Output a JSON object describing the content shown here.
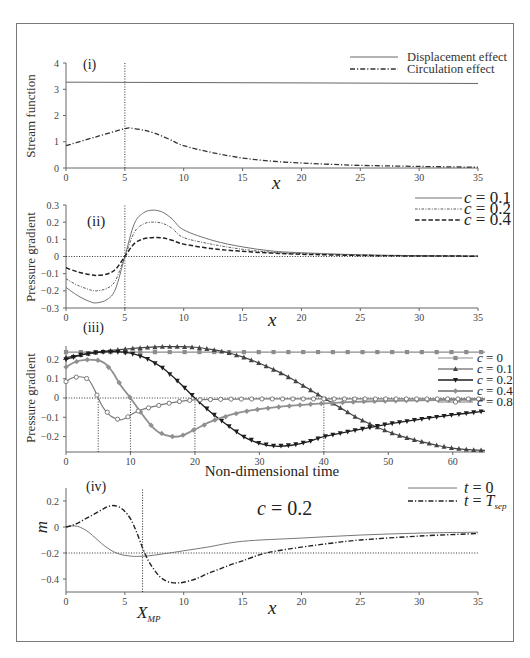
{
  "chart_data": [
    {
      "panel": "(i)",
      "type": "line",
      "title": "",
      "xlabel": "x",
      "ylabel": "Stream function",
      "xlim": [
        0,
        35
      ],
      "ylim": [
        0,
        4
      ],
      "xticks": [
        0,
        5,
        10,
        15,
        20,
        25,
        30,
        35
      ],
      "xtick_labels": [
        "0",
        "5",
        "10",
        "15",
        "20",
        "25",
        "30",
        "35"
      ],
      "yticks": [
        0,
        1,
        2,
        3,
        4
      ],
      "ytick_labels": [
        "0",
        "1",
        "2",
        "3",
        "4"
      ],
      "grid": false,
      "legend_position": "upper right",
      "reference_lines": [
        {
          "orientation": "vertical",
          "value": 5,
          "style": "dotted",
          "color": "#444444"
        }
      ],
      "series": [
        {
          "name": "Displacement effect",
          "line_style": "solid",
          "color": "#666666",
          "line_width": 1,
          "x": [
            0,
            35
          ],
          "y": [
            3.27,
            3.22
          ]
        },
        {
          "name": "Circulation effect",
          "line_style": "dash-dot",
          "color": "#333333",
          "line_width": 1.3,
          "x": [
            0,
            2.5,
            5,
            5.5,
            6.5,
            7.5,
            8.75,
            10,
            12.5,
            15,
            17.5,
            20,
            22.5,
            25,
            30,
            35
          ],
          "y": [
            0.85,
            1.18,
            1.5,
            1.52,
            1.45,
            1.33,
            1.1,
            0.85,
            0.58,
            0.38,
            0.26,
            0.19,
            0.14,
            0.1,
            0.06,
            0.03
          ]
        }
      ]
    },
    {
      "panel": "(ii)",
      "type": "line",
      "title": "",
      "xlabel": "x",
      "ylabel": "Pressure gradient",
      "xlim": [
        0,
        35
      ],
      "ylim": [
        -0.3,
        0.3
      ],
      "xticks": [
        0,
        5,
        10,
        15,
        20,
        25,
        30,
        35
      ],
      "xtick_labels": [
        "0",
        "5",
        "10",
        "15",
        "20",
        "25",
        "30",
        "35"
      ],
      "yticks": [
        -0.3,
        -0.2,
        -0.1,
        0,
        0.1,
        0.2,
        0.3
      ],
      "ytick_labels": [
        "−0.3",
        "−0.2",
        "−0.1",
        "0",
        "0.1",
        "0.2",
        "0.3"
      ],
      "grid": false,
      "legend_position": "upper right",
      "reference_lines": [
        {
          "orientation": "horizontal",
          "value": 0,
          "style": "dotted",
          "color": "#333333"
        },
        {
          "orientation": "vertical",
          "value": 5,
          "style": "dotted",
          "color": "#444444"
        }
      ],
      "series": [
        {
          "name": "c = 0.1",
          "label_var": "c",
          "label_eq": " = 0.1",
          "line_style": "solid",
          "color": "#707070",
          "line_width": 1,
          "x": [
            0,
            1,
            2,
            2.6,
            3.5,
            4.2,
            5,
            5.8,
            6.6,
            7.4,
            8.2,
            9,
            10,
            12.5,
            15,
            17.5,
            20,
            25,
            30,
            35
          ],
          "y": [
            -0.18,
            -0.228,
            -0.262,
            -0.27,
            -0.25,
            -0.19,
            0,
            0.19,
            0.255,
            0.27,
            0.258,
            0.22,
            0.155,
            0.093,
            0.056,
            0.032,
            0.022,
            0.01,
            0.005,
            0.003
          ]
        },
        {
          "name": "c = 0.2",
          "label_var": "c",
          "label_eq": " = 0.2",
          "line_style": "fine-dash-dot",
          "color": "#5a5a5a",
          "line_width": 1,
          "x": [
            0,
            1,
            2,
            2.6,
            3.5,
            4.2,
            5,
            5.8,
            6.6,
            7.4,
            8.2,
            9,
            10,
            12.5,
            15,
            17.5,
            20,
            25,
            30,
            35
          ],
          "y": [
            -0.13,
            -0.168,
            -0.193,
            -0.2,
            -0.185,
            -0.14,
            0,
            0.14,
            0.19,
            0.2,
            0.193,
            0.165,
            0.11,
            0.07,
            0.042,
            0.025,
            0.017,
            0.008,
            0.004,
            0.002
          ]
        },
        {
          "name": "c = 0.4",
          "label_var": "c",
          "label_eq": " = 0.4",
          "line_style": "dashed",
          "color": "#222222",
          "line_width": 1.5,
          "x": [
            0,
            1,
            2,
            2.6,
            3.5,
            4.2,
            5,
            5.8,
            6.6,
            7.4,
            8.2,
            9,
            10,
            12.5,
            15,
            17.5,
            20,
            25,
            30,
            35
          ],
          "y": [
            -0.066,
            -0.09,
            -0.105,
            -0.11,
            -0.102,
            -0.075,
            0,
            0.075,
            0.103,
            0.11,
            0.108,
            0.095,
            0.072,
            0.045,
            0.03,
            0.02,
            0.013,
            0.006,
            0.003,
            0.002
          ]
        }
      ]
    },
    {
      "panel": "(iii)",
      "type": "line",
      "title": "",
      "xlabel": "Non-dimensional time",
      "ylabel": "Pressure gradient",
      "xlim": [
        0,
        65
      ],
      "ylim": [
        -0.28,
        0.27
      ],
      "xticks": [
        0,
        10,
        20,
        30,
        40,
        50,
        60
      ],
      "xtick_labels": [
        "0",
        "10",
        "20",
        "30",
        "40",
        "50",
        "60"
      ],
      "yticks": [
        -0.2,
        -0.1,
        0,
        0.1,
        0.2
      ],
      "ytick_labels": [
        "−0.2",
        "−0.1",
        "0",
        "0.1",
        "0.2"
      ],
      "grid": false,
      "legend_position": "upper right",
      "reference_lines": [
        {
          "orientation": "horizontal",
          "value": 0,
          "style": "dotted",
          "color": "#333333"
        },
        {
          "orientation": "vertical",
          "value": 5,
          "from": -0.28,
          "to": 0,
          "style": "dotted",
          "color": "#444444"
        },
        {
          "orientation": "vertical",
          "value": 10,
          "from": -0.28,
          "to": 0,
          "style": "dotted",
          "color": "#444444"
        },
        {
          "orientation": "vertical",
          "value": 20,
          "from": -0.28,
          "to": 0,
          "style": "dotted",
          "color": "#444444"
        },
        {
          "orientation": "vertical",
          "value": 40,
          "from": -0.28,
          "to": 0,
          "style": "dotted",
          "color": "#444444"
        }
      ],
      "series": [
        {
          "name": "c = 0",
          "label_var": "c",
          "label_eq": " = 0",
          "line_style": "solid",
          "marker": "square",
          "color": "#8c8c8c",
          "line_width": 1.2,
          "x": [
            0,
            65
          ],
          "y": [
            0.238,
            0.238
          ]
        },
        {
          "name": "c = 0.1",
          "label_var": "c",
          "label_eq": " = 0.1",
          "line_style": "solid",
          "marker": "triangle-up",
          "color": "#444444",
          "line_width": 1.2,
          "x": [
            0,
            2.5,
            5,
            7.5,
            10,
            12.5,
            15,
            17.5,
            20,
            22.5,
            25,
            27.5,
            30,
            32.5,
            35,
            37.5,
            40,
            42.5,
            45,
            47.5,
            50,
            52.5,
            55,
            57.5,
            60,
            62.5,
            65
          ],
          "y": [
            0.21,
            0.225,
            0.238,
            0.248,
            0.256,
            0.262,
            0.266,
            0.266,
            0.263,
            0.252,
            0.236,
            0.212,
            0.18,
            0.143,
            0.1,
            0.05,
            0,
            -0.05,
            -0.1,
            -0.14,
            -0.175,
            -0.203,
            -0.225,
            -0.245,
            -0.26,
            -0.268,
            -0.272
          ]
        },
        {
          "name": "c = 0.2",
          "label_var": "c",
          "label_eq": " = 0.2",
          "line_style": "solid",
          "marker": "triangle-down",
          "color": "#1e1e1e",
          "line_width": 1.3,
          "x": [
            0,
            2.5,
            5,
            7.5,
            10,
            12.5,
            15,
            17.5,
            20,
            22.5,
            25,
            27.5,
            30,
            32.5,
            35,
            37.5,
            40,
            45,
            50,
            55,
            60,
            65
          ],
          "y": [
            0.2,
            0.225,
            0.237,
            0.24,
            0.232,
            0.205,
            0.155,
            0.082,
            0,
            -0.075,
            -0.14,
            -0.2,
            -0.235,
            -0.25,
            -0.245,
            -0.228,
            -0.2,
            -0.167,
            -0.135,
            -0.11,
            -0.088,
            -0.068
          ]
        },
        {
          "name": "c = 0.4",
          "label_var": "c",
          "label_eq": " = 0.4",
          "line_style": "solid",
          "marker": "diamond",
          "color": "#909090",
          "line_width": 1.8,
          "x": [
            0,
            1,
            2,
            3,
            4,
            5,
            6,
            7,
            7.5,
            8.5,
            10,
            11.5,
            13,
            14.5,
            16.5,
            18,
            20,
            23,
            27,
            30,
            35,
            40,
            45,
            50,
            55,
            60,
            65
          ],
          "y": [
            0.16,
            0.18,
            0.193,
            0.198,
            0.198,
            0.195,
            0.18,
            0.145,
            0.12,
            0.065,
            0,
            -0.07,
            -0.135,
            -0.18,
            -0.2,
            -0.195,
            -0.163,
            -0.115,
            -0.075,
            -0.058,
            -0.04,
            -0.028,
            -0.02,
            -0.015,
            -0.012,
            -0.01,
            -0.008
          ]
        },
        {
          "name": "c = 0.8",
          "label_var": "c",
          "label_eq": " = 0.8",
          "line_style": "solid",
          "marker": "circle-open",
          "color": "#7a7a7a",
          "line_width": 1.2,
          "x": [
            0,
            1,
            2,
            3,
            3.5,
            4,
            4.5,
            5,
            5.5,
            6,
            7,
            8,
            8.6,
            9.5,
            10,
            11,
            12,
            13.5,
            16,
            18,
            20,
            25,
            30,
            40,
            50,
            65
          ],
          "y": [
            0.085,
            0.105,
            0.11,
            0.105,
            0.095,
            0.07,
            0.038,
            0,
            -0.035,
            -0.06,
            -0.095,
            -0.11,
            -0.113,
            -0.1,
            -0.088,
            -0.07,
            -0.058,
            -0.045,
            -0.027,
            -0.016,
            -0.01,
            -0.006,
            -0.005,
            -0.005,
            -0.005,
            -0.005
          ]
        }
      ]
    },
    {
      "panel": "(iv)",
      "type": "line",
      "title": "",
      "xlabel": "x",
      "ylabel": "m",
      "xlim": [
        0,
        35
      ],
      "ylim": [
        -0.5,
        0.3
      ],
      "xticks": [
        0,
        5,
        10,
        15,
        20,
        25,
        30,
        35
      ],
      "xtick_labels": [
        "0",
        "5",
        "10",
        "15",
        "20",
        "25",
        "30",
        "35"
      ],
      "yticks": [
        -0.4,
        -0.2,
        0,
        0.2
      ],
      "ytick_labels": [
        "−0.4",
        "−0.2",
        "0",
        "0.2"
      ],
      "grid": false,
      "legend_position": "upper right",
      "annotations": {
        "c_label": {
          "var": "c",
          "eq": " = 0.2"
        },
        "x_mp": {
          "sym": "X",
          "sub": "MP",
          "value": 6.5
        }
      },
      "reference_lines": [
        {
          "orientation": "horizontal",
          "value": -0.2,
          "style": "dotted",
          "color": "#333333"
        },
        {
          "orientation": "vertical",
          "value": 6.5,
          "style": "dotted",
          "color": "#333333"
        }
      ],
      "series": [
        {
          "name": "t = 0",
          "label_var": "t",
          "label_eq": " = 0",
          "line_style": "solid",
          "color": "#777777",
          "line_width": 1,
          "x": [
            0,
            0.5,
            1,
            1.5,
            2,
            2.5,
            3,
            3.5,
            4,
            4.5,
            5,
            5.5,
            6,
            7,
            8,
            9,
            10,
            12,
            15,
            20,
            25,
            30,
            35
          ],
          "y": [
            0,
            0.008,
            0.005,
            -0.015,
            -0.045,
            -0.085,
            -0.125,
            -0.16,
            -0.188,
            -0.207,
            -0.218,
            -0.224,
            -0.226,
            -0.222,
            -0.21,
            -0.197,
            -0.183,
            -0.155,
            -0.11,
            -0.085,
            -0.062,
            -0.047,
            -0.04
          ]
        },
        {
          "name": "t = T_sep",
          "label_var": "t",
          "label_eq": " = ",
          "label_sym": "T",
          "label_sub": "sep",
          "line_style": "dash-dot",
          "color": "#222222",
          "line_width": 1.4,
          "x": [
            0,
            0.5,
            1,
            1.5,
            2,
            2.5,
            3,
            3.5,
            4,
            4.5,
            5,
            5.5,
            6,
            6.5,
            7,
            7.5,
            8,
            8.5,
            9,
            9.5,
            10,
            11,
            12,
            13,
            14,
            15,
            17,
            20,
            22.5,
            25,
            30,
            35
          ],
          "y": [
            0,
            0.012,
            0.03,
            0.055,
            0.08,
            0.105,
            0.13,
            0.155,
            0.165,
            0.155,
            0.12,
            0.06,
            -0.04,
            -0.16,
            -0.26,
            -0.33,
            -0.385,
            -0.415,
            -0.428,
            -0.43,
            -0.425,
            -0.4,
            -0.36,
            -0.325,
            -0.29,
            -0.26,
            -0.2,
            -0.155,
            -0.125,
            -0.1,
            -0.07,
            -0.05
          ]
        }
      ]
    }
  ]
}
